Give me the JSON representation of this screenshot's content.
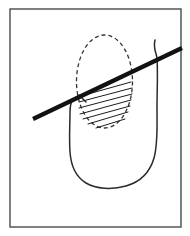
{
  "figure": {
    "canvas": {
      "width": 190,
      "height": 236,
      "background": "#ffffff"
    },
    "frame": {
      "label": "figure border",
      "x": 10,
      "y": 9,
      "width": 171,
      "height": 218,
      "stroke": "#4a4a4a",
      "stroke_width": 1.4,
      "fill": "none"
    },
    "body_outline": {
      "label": "organ body outline",
      "stroke": "#2b2b2b",
      "stroke_width": 1.5,
      "fill": "none",
      "path": "M 155 40 C 153 48 156 52 157 58 C 158 74 157 92 157 108 C 157 126 158 144 154 158 C 150 172 140 182 126 186 C 112 190 96 189 86 183 C 76 177 71 166 70 152 C 69 138 70 124 70 112 C 70 106 71 102 73 99 L 79 95 L 83 99 L 86 102"
    },
    "lesion_ellipse": {
      "label": "dashed lesion outline",
      "cx": 104.5,
      "cy": 81.5,
      "rx": 28,
      "ry": 46.5,
      "stroke": "#333333",
      "stroke_width": 1.3,
      "fill": "none",
      "dash": "4 3"
    },
    "hatch_region": {
      "label": "hatched lower half of lesion",
      "stroke": "#1c1c1c",
      "stroke_width": 1.0,
      "line_count": 7,
      "lines": [
        {
          "x1": 81,
          "y1": 96,
          "x2": 131,
          "y2": 82
        },
        {
          "x1": 79,
          "y1": 102,
          "x2": 132,
          "y2": 88
        },
        {
          "x1": 79,
          "y1": 108,
          "x2": 132,
          "y2": 94
        },
        {
          "x1": 80,
          "y1": 114,
          "x2": 131,
          "y2": 100
        },
        {
          "x1": 83,
          "y1": 119,
          "x2": 130,
          "y2": 106
        },
        {
          "x1": 88,
          "y1": 124,
          "x2": 128,
          "y2": 112
        },
        {
          "x1": 96,
          "y1": 128,
          "x2": 125,
          "y2": 119
        }
      ]
    },
    "needle": {
      "label": "needle crossing the lesion",
      "x1": 33,
      "y1": 119,
      "x2": 182,
      "y2": 48,
      "stroke": "#121212",
      "stroke_width": 4.2,
      "linecap": "butt"
    }
  }
}
